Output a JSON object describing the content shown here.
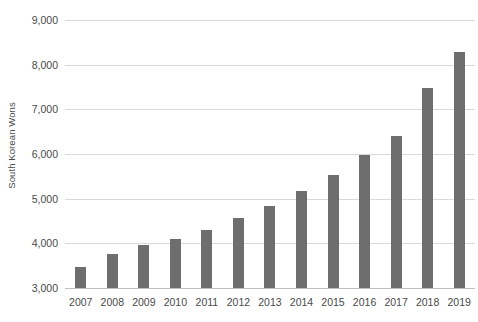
{
  "chart_data": {
    "type": "bar",
    "title": "",
    "subtitle": "",
    "xlabel": "",
    "ylabel": "South Korean Wons",
    "categories": [
      "2007",
      "2008",
      "2009",
      "2010",
      "2011",
      "2012",
      "2013",
      "2014",
      "2015",
      "2016",
      "2017",
      "2018",
      "2019"
    ],
    "values": [
      3470,
      3760,
      3970,
      4100,
      4300,
      4560,
      4840,
      5180,
      5520,
      5970,
      6400,
      7470,
      8280
    ],
    "series": [
      {
        "name": "South Korean Wons",
        "values": [
          3470,
          3760,
          3970,
          4100,
          4300,
          4560,
          4840,
          5180,
          5520,
          5970,
          6400,
          7470,
          8280
        ]
      }
    ],
    "ylim": [
      3000,
      9000
    ],
    "ytick_values": [
      3000,
      4000,
      5000,
      6000,
      7000,
      8000,
      9000
    ],
    "ytick_labels": [
      "3,000",
      "4,000",
      "5,000",
      "6,000",
      "7,000",
      "8,000",
      "9,000"
    ],
    "grid": true,
    "grid_axis": "y",
    "legend": false,
    "legend_position": "none",
    "bar_color": "#6e6e6e",
    "gridline_color": "#d9d9d9",
    "background_color": "#ffffff",
    "text_color": "#4a4a4a"
  }
}
